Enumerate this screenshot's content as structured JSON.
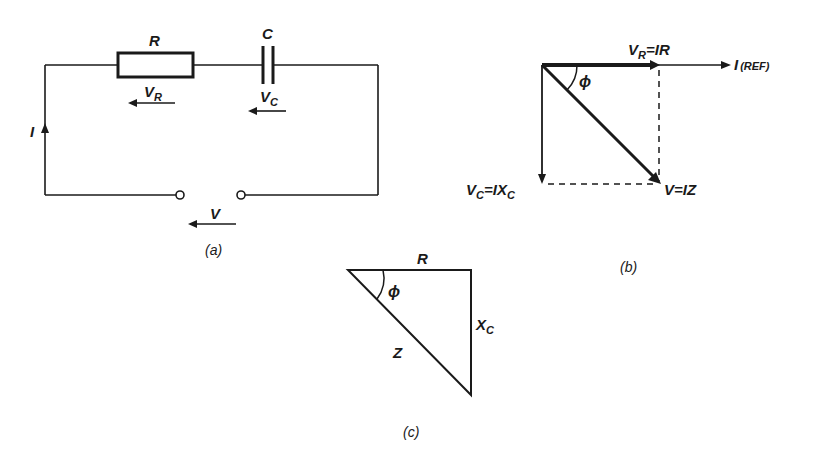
{
  "colors": {
    "ink": "#1a1a1a",
    "background": "#ffffff"
  },
  "circuit": {
    "caption": "(a)",
    "resistor_label": "R",
    "capacitor_label": "C",
    "current_label": "I",
    "vr_label_main": "V",
    "vr_label_sub": "R",
    "vc_label_main": "V",
    "vc_label_sub": "C",
    "supply_label": "V"
  },
  "phasor": {
    "caption": "(b)",
    "vr_main": "V",
    "vr_sub": "R",
    "vr_eq": "=IR",
    "ref_main": "I",
    "ref_note": "(REF)",
    "angle": "ϕ",
    "vc_main": "V",
    "vc_sub": "C",
    "vc_eq": "=IX",
    "vc_eq_sub": "C",
    "v_eq": "V=IZ"
  },
  "impedance_triangle": {
    "caption": "(c)",
    "side_r": "R",
    "side_x_main": "X",
    "side_x_sub": "C",
    "hyp_z": "Z",
    "angle": "ϕ"
  }
}
